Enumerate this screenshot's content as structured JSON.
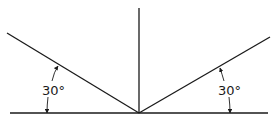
{
  "diagram": {
    "title": "",
    "colors": {
      "line": "#1a1a1a",
      "background": "#ffffff"
    },
    "labels": {
      "left_angle": "30°",
      "right_angle": "30°"
    },
    "geometry": {
      "surface": {
        "x1": 10,
        "y1": 113,
        "x2": 268,
        "y2": 113
      },
      "normal": {
        "x1": 139,
        "y1": 8,
        "x2": 139,
        "y2": 113
      },
      "left_ray": {
        "x1": 7,
        "y1": 33,
        "x2": 139,
        "y2": 113
      },
      "right_ray": {
        "x1": 139,
        "y1": 113,
        "x2": 270,
        "y2": 37
      }
    }
  }
}
